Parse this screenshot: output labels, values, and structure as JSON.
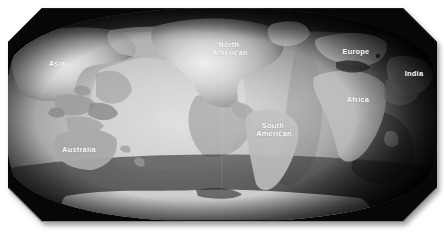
{
  "figure": {
    "kind": "world-tectonic-plate-map",
    "projection": "robinson-style-oval",
    "background_color": "#ffffff",
    "frame": {
      "shape": "beveled-rounded-rect",
      "left": 8,
      "top": 8,
      "right": 437,
      "bottom": 222,
      "corner_bevel": 34,
      "shadow_color": "#b9b9b9"
    },
    "palette": {
      "ocean_light": "#c9c9c9",
      "ocean_mid": "#9a9a9a",
      "ocean_dark": "#4a4a4a",
      "ocean_deep": "#111111",
      "land_light": "#c4c4c4",
      "land_mid": "#a6a6a6",
      "land_dark": "#6f6f6f",
      "antarctica": "#d0d0d0",
      "label_color": "#ffffff",
      "edge_vignette": "#000000"
    }
  },
  "labels": [
    {
      "id": "asia",
      "text": "Asia",
      "x": 57,
      "y": 66,
      "lines": [
        "Asia"
      ]
    },
    {
      "id": "north-american",
      "text": "North American",
      "x": 230,
      "y": 47,
      "lines": [
        "North",
        "American"
      ]
    },
    {
      "id": "europe",
      "text": "Europe",
      "x": 356,
      "y": 54,
      "lines": [
        "Europe"
      ]
    },
    {
      "id": "india",
      "text": "India",
      "x": 414,
      "y": 76,
      "lines": [
        "India"
      ]
    },
    {
      "id": "africa",
      "text": "Africa",
      "x": 358,
      "y": 102,
      "lines": [
        "Africa"
      ]
    },
    {
      "id": "south-american",
      "text": "South American",
      "x": 274,
      "y": 128,
      "lines": [
        "South",
        "American"
      ]
    },
    {
      "id": "australia",
      "text": "Australia",
      "x": 79,
      "y": 152,
      "lines": [
        "Australia"
      ]
    }
  ]
}
